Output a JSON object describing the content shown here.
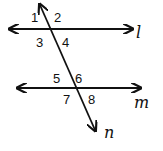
{
  "diagram": {
    "lines": [
      {
        "id": "l",
        "label": "l",
        "kind": "parallel",
        "x1": 10,
        "y1": 29,
        "x2": 132,
        "y2": 29
      },
      {
        "id": "m",
        "label": "m",
        "kind": "parallel",
        "x1": 18,
        "y1": 88,
        "x2": 140,
        "y2": 88
      },
      {
        "id": "n",
        "label": "n",
        "kind": "transversal",
        "x1": 40,
        "y1": 5,
        "x2": 95,
        "y2": 130
      }
    ],
    "angles": [
      {
        "label": "1",
        "x": 31,
        "y": 22
      },
      {
        "label": "2",
        "x": 54,
        "y": 22
      },
      {
        "label": "3",
        "x": 37,
        "y": 46
      },
      {
        "label": "4",
        "x": 62,
        "y": 46
      },
      {
        "label": "5",
        "x": 53,
        "y": 83
      },
      {
        "label": "6",
        "x": 75,
        "y": 83
      },
      {
        "label": "7",
        "x": 63,
        "y": 104
      },
      {
        "label": "8",
        "x": 88,
        "y": 104
      }
    ],
    "line_labels": {
      "l": "l",
      "m": "m",
      "n": "n"
    },
    "colors": {
      "stroke": "#111111",
      "background": "#ffffff"
    }
  }
}
